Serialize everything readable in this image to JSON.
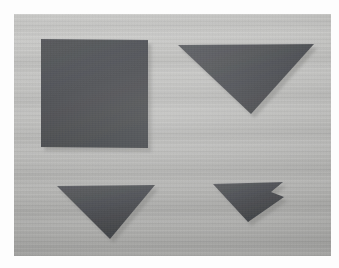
{
  "scene": {
    "title": "Photograph of four dark paper shapes on a light wooden work surface",
    "medium": "photograph",
    "frame_border_color": "#fdfdfd",
    "surface": {
      "name": "wooden work surface",
      "description": "light gray wood-grain board with fine horizontal striations",
      "base_color": "#bcbcba",
      "highlight_color": "#cfcfcd",
      "shadow_color": "#a8a8a6"
    },
    "object_color": "#4b4d51",
    "object_color_light": "#5a5c60",
    "object_color_dark": "#3f4145",
    "shadow_color": "#8e8e8c",
    "object_count": 4,
    "photo_rect": {
      "x": 14,
      "y": 14,
      "width": 317,
      "height": 242
    }
  },
  "objects": [
    {
      "id": "square",
      "label": "square sheet",
      "shape_type": "square",
      "color": "#4b4d51",
      "vertex_count": 4,
      "points": "41,39 148,40 148,148 41,147",
      "shadow_points": "43,147 150,148 150,152 43,151"
    },
    {
      "id": "large-triangle",
      "label": "large inverted triangle",
      "shape_type": "triangle",
      "color": "#4b4d51",
      "vertex_count": 3,
      "points": "178,45 314,44 251,114",
      "shadow_points": "180,47 251,114 253,118 243,112"
    },
    {
      "id": "medium-triangle",
      "label": "medium inverted triangle",
      "shape_type": "triangle",
      "color": "#4b4d51",
      "vertex_count": 3,
      "points": "57,186 155,185 110,239",
      "shadow_points": "59,187 110,239 112,243 104,236"
    },
    {
      "id": "notched-triangle",
      "label": "small triangle with notched corner",
      "shape_type": "notched-triangle",
      "color": "#4b4d51",
      "vertex_count": 6,
      "points": "213,184 283,182 271,192 284,197 248,222",
      "shadow_points": "215,186 248,222 250,226 242,219"
    }
  ]
}
